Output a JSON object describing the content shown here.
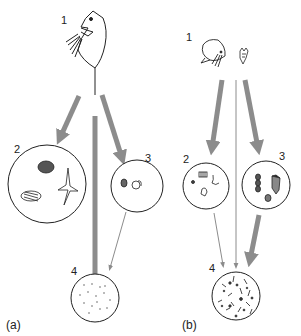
{
  "figure": {
    "panels": [
      {
        "id": "a",
        "label": "(a)",
        "nodes": [
          {
            "id": "1",
            "label": "1",
            "content": "large zooplankton (cladoceran-like grazer)"
          },
          {
            "id": "2",
            "label": "2",
            "content": "large phytoplankton (colonies, diatoms, spined cells)"
          },
          {
            "id": "3",
            "label": "3",
            "content": "small protists"
          },
          {
            "id": "4",
            "label": "4",
            "content": "sparse bacteria / detritus"
          }
        ],
        "arrows": [
          {
            "from": "1",
            "to": "2",
            "weight": "thick"
          },
          {
            "from": "1",
            "to": "4",
            "weight": "thick"
          },
          {
            "from": "1",
            "to": "3",
            "weight": "thick"
          },
          {
            "from": "3",
            "to": "4",
            "weight": "thin"
          }
        ]
      },
      {
        "id": "b",
        "label": "(b)",
        "nodes": [
          {
            "id": "1",
            "label": "1",
            "content": "small zooplankton (copepod and rotifer)"
          },
          {
            "id": "2",
            "label": "2",
            "content": "small algae"
          },
          {
            "id": "3",
            "label": "3",
            "content": "ciliates / protists"
          },
          {
            "id": "4",
            "label": "4",
            "content": "dense bacteria / microbial community"
          }
        ],
        "arrows": [
          {
            "from": "1",
            "to": "2",
            "weight": "thick"
          },
          {
            "from": "1",
            "to": "4",
            "weight": "thin"
          },
          {
            "from": "1",
            "to": "3",
            "weight": "thick"
          },
          {
            "from": "2",
            "to": "4",
            "weight": "thin"
          },
          {
            "from": "3",
            "to": "4",
            "weight": "thick"
          }
        ]
      }
    ],
    "colors": {
      "arrow": "#8c8c8c",
      "outline": "#222222"
    }
  }
}
